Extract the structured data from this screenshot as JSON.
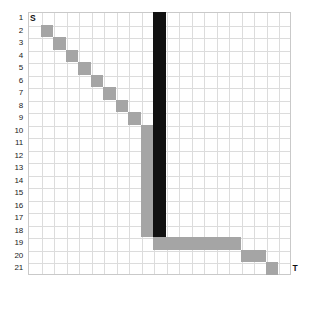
{
  "figure": {
    "type": "grid-path-diagram",
    "grid": {
      "columns": 21,
      "rows": 21,
      "cell_size_px": 12.5,
      "origin_x_px": 28,
      "origin_y_px": 12,
      "grid_line_color": "#dcdcdc",
      "border_color": "#c9c9c9",
      "background": "#ffffff"
    },
    "row_labels": [
      "1",
      "2",
      "3",
      "4",
      "5",
      "6",
      "7",
      "8",
      "9",
      "10",
      "11",
      "12",
      "13",
      "14",
      "15",
      "16",
      "17",
      "18",
      "19",
      "20",
      "21"
    ],
    "endpoints": [
      {
        "name": "start",
        "label": "S",
        "row": 1,
        "col": 1
      },
      {
        "name": "target",
        "label": "T",
        "row": 21,
        "col": 21
      }
    ],
    "colors": {
      "path_gray": "#a5a5a5",
      "barrier_dark": "#111111"
    },
    "segments": [
      {
        "name": "diagonal-staircase",
        "color": "#a5a5a5",
        "cells": [
          {
            "row": 2,
            "col": 2
          },
          {
            "row": 3,
            "col": 3
          },
          {
            "row": 4,
            "col": 4
          },
          {
            "row": 5,
            "col": 5
          },
          {
            "row": 6,
            "col": 6
          },
          {
            "row": 7,
            "col": 7
          },
          {
            "row": 8,
            "col": 8
          },
          {
            "row": 9,
            "col": 9
          },
          {
            "row": 10,
            "col": 10
          }
        ]
      },
      {
        "name": "vertical-descent",
        "color": "#a5a5a5",
        "col": 10,
        "row_start": 10,
        "row_end": 18
      },
      {
        "name": "dark-barrier",
        "color": "#111111",
        "col": 11,
        "row_start": 1,
        "row_end": 18
      },
      {
        "name": "horizontal-run",
        "color": "#a5a5a5",
        "row": 19,
        "col_start": 11,
        "col_end": 17
      },
      {
        "name": "step-two",
        "color": "#a5a5a5",
        "row": 20,
        "col_start": 18,
        "col_end": 19
      },
      {
        "name": "step-three",
        "color": "#a5a5a5",
        "row": 21,
        "col_start": 20,
        "col_end": 20
      }
    ]
  }
}
